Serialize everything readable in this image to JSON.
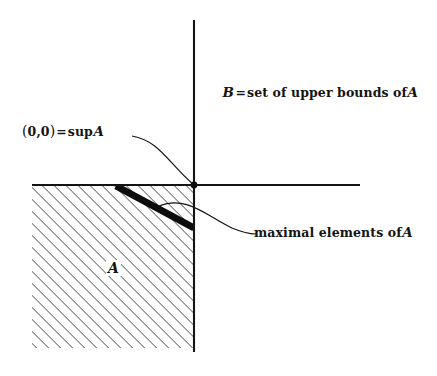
{
  "figure": {
    "background_color": "#ffffff",
    "ink_color": "#141414"
  },
  "axes": {
    "horizontal": {
      "name": "horizontal-axis",
      "x1": 32,
      "y1": 185,
      "x2": 360,
      "y2": 185
    },
    "vertical": {
      "name": "vertical-axis",
      "x1": 194,
      "y1": 20,
      "x2": 194,
      "y2": 352
    },
    "origin_point": {
      "cx": 194,
      "cy": 185,
      "r": 3.4
    }
  },
  "region_a": {
    "name": "hatched-region-A",
    "left": 32,
    "top": 185,
    "right": 194,
    "bottom": 348,
    "hatch_angle_deg": 45,
    "hatch_spacing": 6,
    "hatch_width": 1.1
  },
  "maximal_band": {
    "name": "maximal-elements-band",
    "x1": 116,
    "y1": 186,
    "x2": 194,
    "y2": 228,
    "thickness": 7
  },
  "leaders": {
    "sup_leader": {
      "path": "M 132 136 C 160 141, 168 163, 194 185"
    },
    "maximal_leader": {
      "path": "M 157 207 C 186 194, 205 215, 232 228 C 244 233, 250 234, 256 234"
    }
  },
  "labels": {
    "upper_bounds": {
      "variable": "B",
      "equals": "=",
      "text": "set of upper bounds of",
      "set": "A"
    },
    "supremum": {
      "open_paren": "(",
      "coord_x": "0",
      "comma": ",",
      "coord_y": "0",
      "close_paren": ")",
      "equals": "=",
      "operator": "sup",
      "set": "A"
    },
    "maximal_elements": {
      "text": "maximal elements of",
      "set": "A"
    },
    "set_a": "A"
  }
}
